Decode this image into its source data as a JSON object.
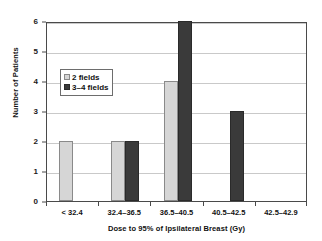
{
  "chart_data": {
    "type": "bar",
    "title": "",
    "subtitle": "",
    "xlabel": "Dose to 95% of Ipsilateral Breast (Gy)",
    "ylabel": "Number of Patients",
    "categories": [
      "< 32.4",
      "32.4–36.5",
      "36.5–40.5",
      "40.5–42.5",
      "42.5–42.9"
    ],
    "series": [
      {
        "name": "2 fields",
        "values": [
          2,
          2,
          4,
          0,
          0
        ],
        "color": "#d6d6d6"
      },
      {
        "name": "3–4 fields",
        "values": [
          0,
          2,
          6,
          3,
          0
        ],
        "color": "#3a3a3a"
      }
    ],
    "ylim": [
      0,
      6
    ],
    "yticks": [
      0,
      1,
      2,
      3,
      4,
      5,
      6
    ],
    "ytick_labels": [
      "0",
      "1",
      "2",
      "3",
      "4",
      "5",
      "6"
    ],
    "grid": "horizontal",
    "legend_position": "upper-left-inside",
    "annotations": []
  }
}
